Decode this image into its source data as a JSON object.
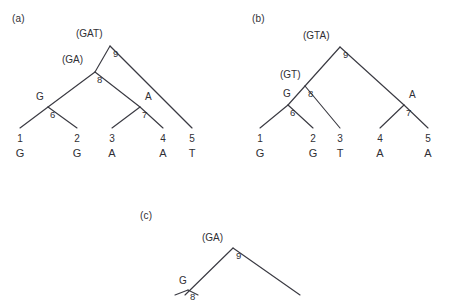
{
  "figure": {
    "background_color": "#ffffff",
    "line_color": "#3a3a42",
    "text_color": "#2f2f35"
  },
  "panels": [
    {
      "id": "a",
      "label": "(a)",
      "label_pos": {
        "x": 12,
        "y": 14
      },
      "root": {
        "id": "9",
        "x": 110,
        "y": 46
      },
      "internal_nodes": [
        {
          "id": "9",
          "x": 110,
          "y": 46,
          "num_pos": {
            "x": 113,
            "y": 49
          }
        },
        {
          "id": "8",
          "x": 95,
          "y": 72,
          "num_pos": {
            "x": 97,
            "y": 75
          }
        },
        {
          "id": "7",
          "x": 140,
          "y": 107,
          "num_pos": {
            "x": 142,
            "y": 110
          }
        },
        {
          "id": "6",
          "x": 48,
          "y": 107,
          "num_pos": {
            "x": 50,
            "y": 110
          }
        }
      ],
      "annotations": [
        {
          "text": "(GAT)",
          "x": 76,
          "y": 29,
          "kind": "state-set",
          "node": "9"
        },
        {
          "text": "(GA)",
          "x": 62,
          "y": 55,
          "kind": "state-set",
          "node": "8"
        },
        {
          "text": "G",
          "x": 36,
          "y": 92,
          "kind": "state-anc",
          "node": "6"
        },
        {
          "text": "A",
          "x": 145,
          "y": 92,
          "kind": "state-anc",
          "node": "7"
        }
      ],
      "leaves": [
        {
          "num": "1",
          "state": "G",
          "x": 20,
          "y": 134
        },
        {
          "num": "2",
          "state": "G",
          "x": 77,
          "y": 134
        },
        {
          "num": "3",
          "state": "A",
          "x": 112,
          "y": 134
        },
        {
          "num": "4",
          "state": "A",
          "x": 163,
          "y": 134
        },
        {
          "num": "5",
          "state": "T",
          "x": 192,
          "y": 134
        }
      ],
      "edges": [
        {
          "from": {
            "x": 110,
            "y": 46
          },
          "to": {
            "x": 95,
            "y": 72
          }
        },
        {
          "from": {
            "x": 110,
            "y": 46
          },
          "to": {
            "x": 192,
            "y": 128
          }
        },
        {
          "from": {
            "x": 95,
            "y": 72
          },
          "to": {
            "x": 48,
            "y": 107
          }
        },
        {
          "from": {
            "x": 95,
            "y": 72
          },
          "to": {
            "x": 140,
            "y": 107
          }
        },
        {
          "from": {
            "x": 48,
            "y": 107
          },
          "to": {
            "x": 20,
            "y": 128
          }
        },
        {
          "from": {
            "x": 48,
            "y": 107
          },
          "to": {
            "x": 77,
            "y": 128
          }
        },
        {
          "from": {
            "x": 140,
            "y": 107
          },
          "to": {
            "x": 112,
            "y": 128
          }
        },
        {
          "from": {
            "x": 140,
            "y": 107
          },
          "to": {
            "x": 163,
            "y": 128
          }
        }
      ]
    },
    {
      "id": "b",
      "label": "(b)",
      "label_pos": {
        "x": 252,
        "y": 14
      },
      "root": {
        "id": "9",
        "x": 340,
        "y": 47
      },
      "internal_nodes": [
        {
          "id": "9",
          "x": 340,
          "y": 47,
          "num_pos": {
            "x": 343,
            "y": 50
          }
        },
        {
          "id": "8",
          "x": 305,
          "y": 86,
          "num_pos": {
            "x": 308,
            "y": 89
          }
        },
        {
          "id": "7",
          "x": 404,
          "y": 105,
          "num_pos": {
            "x": 406,
            "y": 108
          }
        },
        {
          "id": "6",
          "x": 288,
          "y": 105,
          "num_pos": {
            "x": 290,
            "y": 108
          }
        }
      ],
      "annotations": [
        {
          "text": "(GTA)",
          "x": 303,
          "y": 31,
          "kind": "state-set",
          "node": "9"
        },
        {
          "text": "(GT)",
          "x": 280,
          "y": 70,
          "kind": "state-set",
          "node": "8"
        },
        {
          "text": "G",
          "x": 283,
          "y": 89,
          "kind": "state-anc",
          "node": "8"
        },
        {
          "text": "A",
          "x": 409,
          "y": 90,
          "kind": "state-anc",
          "node": "7"
        }
      ],
      "leaves": [
        {
          "num": "1",
          "state": "G",
          "x": 260,
          "y": 134
        },
        {
          "num": "2",
          "state": "G",
          "x": 313,
          "y": 134
        },
        {
          "num": "3",
          "state": "T",
          "x": 340,
          "y": 134
        },
        {
          "num": "4",
          "state": "A",
          "x": 380,
          "y": 134
        },
        {
          "num": "5",
          "state": "A",
          "x": 428,
          "y": 134
        }
      ],
      "edges": [
        {
          "from": {
            "x": 340,
            "y": 47
          },
          "to": {
            "x": 305,
            "y": 86
          }
        },
        {
          "from": {
            "x": 340,
            "y": 47
          },
          "to": {
            "x": 404,
            "y": 105
          }
        },
        {
          "from": {
            "x": 305,
            "y": 86
          },
          "to": {
            "x": 288,
            "y": 105
          }
        },
        {
          "from": {
            "x": 305,
            "y": 86
          },
          "to": {
            "x": 340,
            "y": 128
          }
        },
        {
          "from": {
            "x": 288,
            "y": 105
          },
          "to": {
            "x": 260,
            "y": 128
          }
        },
        {
          "from": {
            "x": 288,
            "y": 105
          },
          "to": {
            "x": 313,
            "y": 128
          }
        },
        {
          "from": {
            "x": 404,
            "y": 105
          },
          "to": {
            "x": 380,
            "y": 128
          }
        },
        {
          "from": {
            "x": 404,
            "y": 105
          },
          "to": {
            "x": 428,
            "y": 128
          }
        }
      ]
    },
    {
      "id": "c",
      "label": "(c)",
      "label_pos": {
        "x": 140,
        "y": 211
      },
      "root": {
        "id": "9",
        "x": 233,
        "y": 248
      },
      "internal_nodes": [
        {
          "id": "9",
          "x": 233,
          "y": 248,
          "num_pos": {
            "x": 236,
            "y": 251
          }
        },
        {
          "id": "8",
          "x": 188,
          "y": 290,
          "num_pos": {
            "x": 190,
            "y": 292
          }
        }
      ],
      "annotations": [
        {
          "text": "(GA)",
          "x": 202,
          "y": 233,
          "kind": "state-set",
          "node": "9"
        },
        {
          "text": "G",
          "x": 179,
          "y": 276,
          "kind": "state-anc",
          "node": "8"
        }
      ],
      "leaves": [],
      "edges": [
        {
          "from": {
            "x": 233,
            "y": 248
          },
          "to": {
            "x": 185,
            "y": 295
          }
        },
        {
          "from": {
            "x": 233,
            "y": 248
          },
          "to": {
            "x": 300,
            "y": 295
          }
        },
        {
          "from": {
            "x": 188,
            "y": 290
          },
          "to": {
            "x": 175,
            "y": 295
          }
        },
        {
          "from": {
            "x": 188,
            "y": 290
          },
          "to": {
            "x": 198,
            "y": 295
          }
        }
      ]
    }
  ]
}
